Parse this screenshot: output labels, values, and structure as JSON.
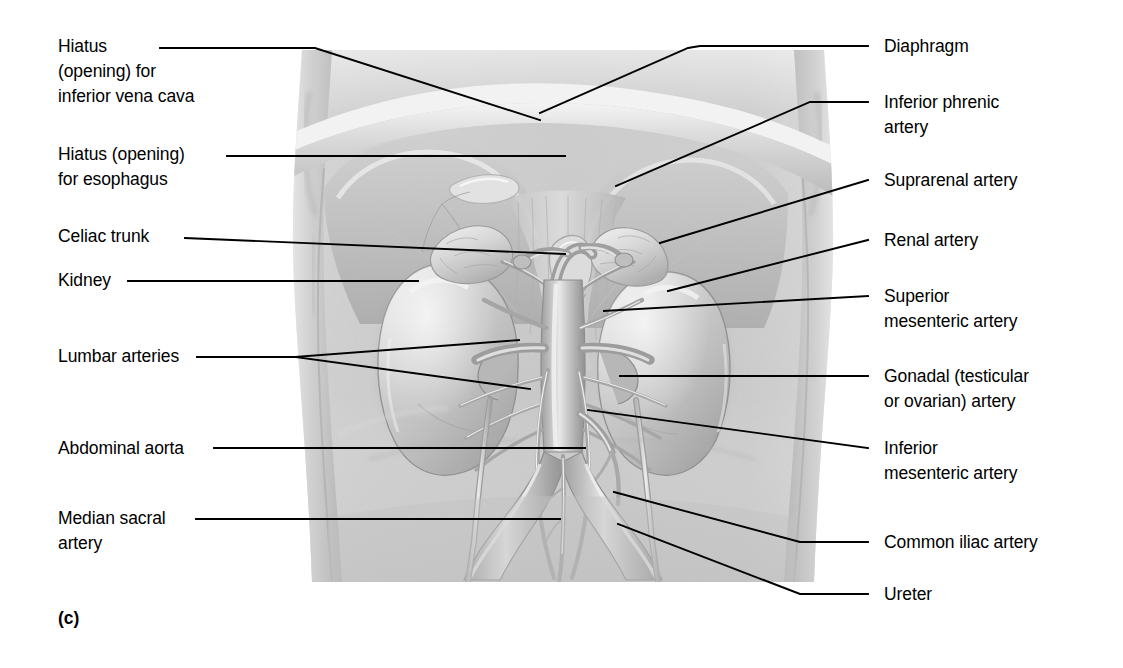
{
  "figure": {
    "panel_letter": "(c)"
  },
  "labels_left": [
    {
      "id": "hiatus-inferior-vena-cava",
      "text": "Hiatus\n(opening) for\ninferior vena cava",
      "x": 58,
      "y": 34
    },
    {
      "id": "hiatus-esophagus",
      "text": "Hiatus (opening)\nfor esophagus",
      "x": 58,
      "y": 142
    },
    {
      "id": "celiac-trunk",
      "text": "Celiac trunk",
      "x": 58,
      "y": 224
    },
    {
      "id": "kidney",
      "text": "Kidney",
      "x": 58,
      "y": 268
    },
    {
      "id": "lumbar-arteries",
      "text": "Lumbar arteries",
      "x": 58,
      "y": 344
    },
    {
      "id": "abdominal-aorta",
      "text": "Abdominal aorta",
      "x": 58,
      "y": 436
    },
    {
      "id": "median-sacral-artery",
      "text": "Median sacral\nartery",
      "x": 58,
      "y": 506
    }
  ],
  "labels_right": [
    {
      "id": "diaphragm",
      "text": "Diaphragm",
      "x": 884,
      "y": 34
    },
    {
      "id": "inferior-phrenic-artery",
      "text": "Inferior phrenic\nartery",
      "x": 884,
      "y": 90
    },
    {
      "id": "suprarenal-artery",
      "text": "Suprarenal artery",
      "x": 884,
      "y": 168
    },
    {
      "id": "renal-artery",
      "text": "Renal artery",
      "x": 884,
      "y": 228
    },
    {
      "id": "superior-mesenteric-artery",
      "text": "Superior\nmesenteric artery",
      "x": 884,
      "y": 284
    },
    {
      "id": "gonadal-artery",
      "text": "Gonadal (testicular\nor ovarian) artery",
      "x": 884,
      "y": 364
    },
    {
      "id": "inferior-mesenteric-artery",
      "text": "Inferior\nmesenteric artery",
      "x": 884,
      "y": 436
    },
    {
      "id": "common-iliac-artery",
      "text": "Common iliac artery",
      "x": 884,
      "y": 530
    },
    {
      "id": "ureter",
      "text": "Ureter",
      "x": 884,
      "y": 582
    }
  ],
  "colors": {
    "leader_line": "#000000",
    "text": "#000000",
    "background": "#ffffff",
    "torso_light": "#dcdcdc",
    "torso_mid": "#c6c6c6",
    "torso_shadow": "#a8a8a8",
    "vessel": "#b4b4b4",
    "vessel_highlight": "#e4e4e4",
    "organ": "#bdbdbd"
  }
}
